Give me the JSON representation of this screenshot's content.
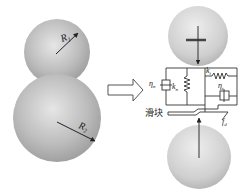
{
  "figure": {
    "left_model": {
      "description": "two bonded spheres (particle pair)",
      "top_sphere_label": "R",
      "top_sphere_sub": "1",
      "bottom_sphere_label": "R",
      "bottom_sphere_sub": "2"
    },
    "arrow": "hollow right arrow",
    "right_model": {
      "description": "contact model between two spheres",
      "normal_damper_label": "η",
      "normal_damper_sub": "n",
      "normal_spring_label": "k",
      "normal_spring_sub": "n",
      "tangential_spring_label": "k",
      "tangential_spring_sub": "t",
      "tangential_damper_label": "η",
      "tangential_damper_sub": "t",
      "slider_label": "滑块",
      "friction_label": "f",
      "friction_sub": "d"
    },
    "colors": {
      "sphere": "#b5b5b5",
      "sphere_light": "#e8e8e8",
      "line": "#333333"
    }
  }
}
